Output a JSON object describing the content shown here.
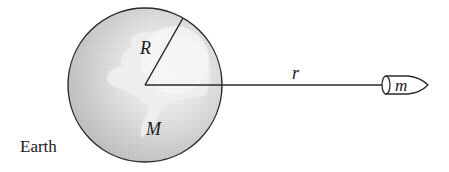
{
  "diagram": {
    "type": "gravitation-diagram",
    "labels": {
      "planet_name": "Earth",
      "planet_radius": "R",
      "planet_mass": "M",
      "distance": "r",
      "object_mass": "m"
    },
    "elements": {
      "planet": {
        "shape": "circle",
        "icon": "globe-icon",
        "center": [
          145,
          85
        ],
        "radius": 77
      },
      "radius_line": {
        "from": [
          145,
          85
        ],
        "to": [
          183,
          18
        ]
      },
      "distance_line": {
        "from": [
          145,
          85
        ],
        "to": [
          383,
          85
        ]
      },
      "object": {
        "shape": "bullet",
        "icon": "projectile-icon",
        "left_x": 383,
        "tip_x": 427,
        "center_y": 85
      }
    },
    "colors": {
      "stroke": "#2a2a2a",
      "globe_edge": "#c4c4c4",
      "globe_highlight": "#f7f7f7",
      "continent": "#ededed",
      "background": "#ffffff"
    }
  }
}
